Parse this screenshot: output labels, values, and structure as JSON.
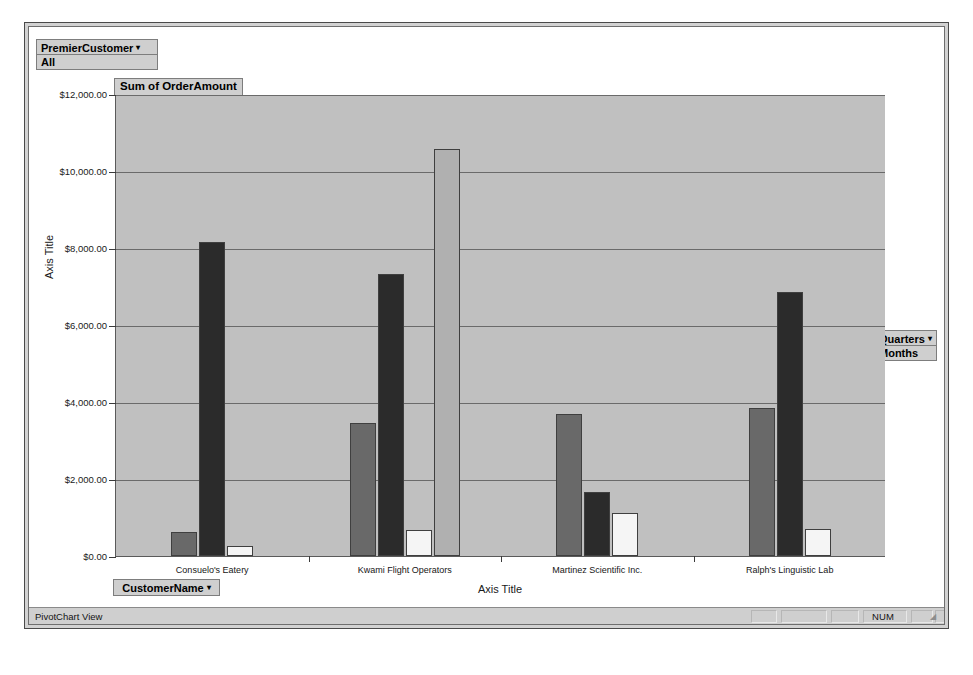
{
  "window": {
    "status_left": "PivotChart View",
    "status_num": "NUM"
  },
  "filter_field": {
    "label": "PremierCustomer",
    "caret": "▾",
    "value": "All"
  },
  "series_field": {
    "label": "Quarters",
    "caret": "▾",
    "value": "Months"
  },
  "category_field": {
    "label": "CustomerName",
    "caret": "▾"
  },
  "chart_data": {
    "type": "bar",
    "title": "Sum of OrderAmount",
    "xlabel": "Axis Title",
    "ylabel": "Axis Title",
    "grid": true,
    "legend_position": "none",
    "ylim": [
      0,
      12000
    ],
    "ytick_labels": [
      "$12,000.00",
      "$10,000.00",
      "$8,000.00",
      "$6,000.00",
      "$4,000.00",
      "$2,000.00",
      "$0.00"
    ],
    "ytick_values": [
      12000,
      10000,
      8000,
      6000,
      4000,
      2000,
      0
    ],
    "categories": [
      "Consuelo's Eatery",
      "Kwami Flight Operators",
      "Martinez Scientific Inc.",
      "Ralph's Linguistic Lab"
    ],
    "series": [
      {
        "name": "Qtr1",
        "color": "#696969",
        "values": [
          620,
          3450,
          3690,
          3850
        ]
      },
      {
        "name": "Qtr2",
        "color": "#2b2b2b",
        "values": [
          8150,
          7320,
          1660,
          6870
        ]
      },
      {
        "name": "Qtr3",
        "color": "#f5f5f5",
        "values": [
          260,
          670,
          1120,
          700
        ]
      },
      {
        "name": "Qtr4",
        "color": "#b0b0b0",
        "values": [
          0,
          10570,
          0,
          0
        ]
      }
    ]
  }
}
